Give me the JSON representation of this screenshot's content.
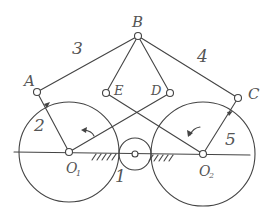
{
  "diagram": {
    "type": "linkage mechanism sketch",
    "joints": {
      "A": "A",
      "B": "B",
      "C": "C",
      "D": "D",
      "E": "E",
      "O1_main": "O",
      "O1_sub": "1",
      "O2_main": "O",
      "O2_sub": "2"
    },
    "links": {
      "frame": "1",
      "crank_left": "2",
      "coupler_left": "3",
      "coupler_right": "4",
      "crank_right": "5"
    },
    "rotation_arrows": [
      "counterclockwise",
      "counterclockwise"
    ],
    "ink_color": "#444444",
    "background": "#ffffff"
  }
}
